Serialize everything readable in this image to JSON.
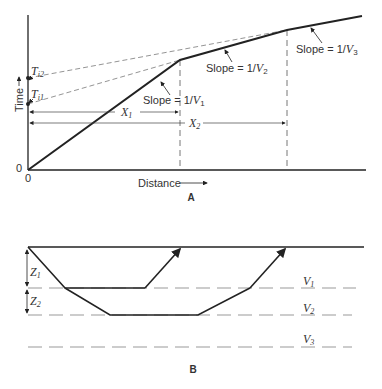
{
  "panel_a": {
    "label": "A",
    "y_axis_label": "Time",
    "x_axis_label": "Distance",
    "origin_x": "0",
    "origin_y": "0",
    "intercepts": [
      {
        "symbol": "T",
        "sub": "i2"
      },
      {
        "symbol": "T",
        "sub": "i1"
      }
    ],
    "slopes": [
      {
        "prefix": "Slope = 1/",
        "symbol": "V",
        "sub": "1"
      },
      {
        "prefix": "Slope = 1/",
        "symbol": "V",
        "sub": "2"
      },
      {
        "prefix": "Slope = 1/",
        "symbol": "V",
        "sub": "3"
      }
    ],
    "crossover_distances": [
      {
        "symbol": "X",
        "sub": "1"
      },
      {
        "symbol": "X",
        "sub": "2"
      }
    ]
  },
  "panel_b": {
    "label": "B",
    "thicknesses": [
      {
        "symbol": "Z",
        "sub": "1"
      },
      {
        "symbol": "Z",
        "sub": "2"
      }
    ],
    "layer_velocities": [
      {
        "symbol": "V",
        "sub": "1"
      },
      {
        "symbol": "V",
        "sub": "2"
      },
      {
        "symbol": "V",
        "sub": "3"
      }
    ]
  },
  "colors": {
    "ink": "#222222",
    "dash": "#888888",
    "background": "#ffffff"
  }
}
